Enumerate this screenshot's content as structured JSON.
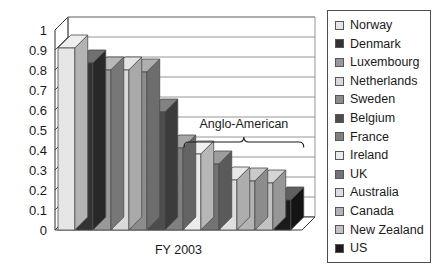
{
  "chart_data": {
    "type": "bar",
    "title": "",
    "subtitle": "",
    "xlabel": "FY 2003",
    "ylabel": "",
    "ylim": [
      0,
      1
    ],
    "ytick_labels": [
      "0",
      "0.1",
      "0.2",
      "0.3",
      "0.4",
      "0.5",
      "0.6",
      "0.7",
      "0.8",
      "0.9",
      "1"
    ],
    "ytick_values": [
      0,
      0.1,
      0.2,
      0.3,
      0.4,
      0.5,
      0.6,
      0.7,
      0.8,
      0.9,
      1
    ],
    "grid": true,
    "legend_position": "right",
    "style": "3d-column",
    "categories": [
      "Norway",
      "Denmark",
      "Luxembourg",
      "Netherlands",
      "Sweden",
      "Belgium",
      "France",
      "Ireland",
      "UK",
      "Australia",
      "Canada",
      "New Zealand",
      "US"
    ],
    "values": [
      0.91,
      0.835,
      0.8,
      0.8,
      0.79,
      0.59,
      0.41,
      0.38,
      0.33,
      0.25,
      0.245,
      0.235,
      0.15
    ],
    "bar_colors": [
      "#e6e6e6",
      "#333333",
      "#999999",
      "#d9d9d9",
      "#8c8c8c",
      "#4d4d4d",
      "#808080",
      "#ebebeb",
      "#737373",
      "#dedede",
      "#b3b3b3",
      "#c2c2c2",
      "#1a1a1a"
    ],
    "annotations": [
      {
        "text": "Anglo-American",
        "type": "brace-label",
        "covers": [
          "Ireland",
          "UK",
          "Australia",
          "Canada",
          "New Zealand",
          "US"
        ]
      }
    ]
  },
  "legend": {
    "items": [
      {
        "label": "Norway",
        "color": "#e6e6e6"
      },
      {
        "label": "Denmark",
        "color": "#333333"
      },
      {
        "label": "Luxembourg",
        "color": "#999999"
      },
      {
        "label": "Netherlands",
        "color": "#d9d9d9"
      },
      {
        "label": "Sweden",
        "color": "#8c8c8c"
      },
      {
        "label": "Belgium",
        "color": "#4d4d4d"
      },
      {
        "label": "France",
        "color": "#808080"
      },
      {
        "label": "Ireland",
        "color": "#ebebeb"
      },
      {
        "label": "UK",
        "color": "#737373"
      },
      {
        "label": "Australia",
        "color": "#dedede"
      },
      {
        "label": "Canada",
        "color": "#b3b3b3"
      },
      {
        "label": "New Zealand",
        "color": "#c2c2c2"
      },
      {
        "label": "US",
        "color": "#1a1a1a"
      }
    ]
  },
  "colors": {
    "axis": "#3d3d3d",
    "grid": "#8a8a8a",
    "outline": "#4a4a4a",
    "text": "#1a1a1a",
    "background": "#ffffff"
  }
}
